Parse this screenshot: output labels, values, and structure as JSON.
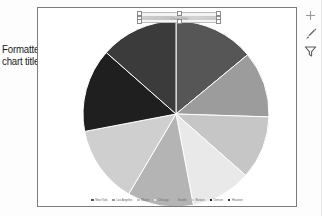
{
  "annotation": {
    "line1": "Formatted",
    "line2": "chart title",
    "leader_name": "leader-line"
  },
  "chart_title": {
    "text": "",
    "placeholder": "Chart Title",
    "state": "selected"
  },
  "side_buttons": [
    {
      "name": "chart-elements-button",
      "icon": "plus-icon",
      "label": "Chart Elements"
    },
    {
      "name": "chart-styles-button",
      "icon": "brush-icon",
      "label": "Chart Styles"
    },
    {
      "name": "chart-filters-button",
      "icon": "funnel-icon",
      "label": "Chart Filters"
    }
  ],
  "chart_data": {
    "type": "pie",
    "title": "Chart Title",
    "xlabel": "",
    "ylabel": "",
    "legend_position": "bottom",
    "grid": false,
    "categories": [
      "New York",
      "Los Angeles",
      "Miami",
      "Chicago",
      "Seattle",
      "Boston",
      "Denver",
      "Houston"
    ],
    "values": [
      14.0,
      11.5,
      11.0,
      10.5,
      11.5,
      13.5,
      14.5,
      13.5
    ],
    "colors": [
      "#565656",
      "#9c9c9c",
      "#c6c6c6",
      "#e9e9e9",
      "#b4b4b4",
      "#cfcfcf",
      "#1f1f1f",
      "#3b3b3b"
    ],
    "slices": [
      {
        "label": "New York",
        "value": 14.0,
        "start_angle": 0,
        "end_angle": 50.4,
        "color": "#565656"
      },
      {
        "label": "Los Angeles",
        "value": 11.5,
        "start_angle": 50.4,
        "end_angle": 91.8,
        "color": "#9c9c9c"
      },
      {
        "label": "Miami",
        "value": 11.0,
        "start_angle": 91.8,
        "end_angle": 131.4,
        "color": "#c6c6c6"
      },
      {
        "label": "Chicago",
        "value": 10.5,
        "start_angle": 131.4,
        "end_angle": 169.2,
        "color": "#e9e9e9"
      },
      {
        "label": "Seattle",
        "value": 11.5,
        "start_angle": 169.2,
        "end_angle": 210.6,
        "color": "#b4b4b4"
      },
      {
        "label": "Boston",
        "value": 13.5,
        "start_angle": 210.6,
        "end_angle": 259.2,
        "color": "#cfcfcf"
      },
      {
        "label": "Denver",
        "value": 14.5,
        "start_angle": 259.2,
        "end_angle": 311.4,
        "color": "#1f1f1f"
      },
      {
        "label": "Houston",
        "value": 13.5,
        "start_angle": 311.4,
        "end_angle": 360.0,
        "color": "#3b3b3b"
      }
    ]
  }
}
